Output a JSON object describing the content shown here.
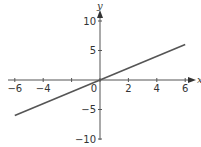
{
  "chart_data": {
    "type": "line",
    "title": "",
    "xlabel": "x",
    "ylabel": "y",
    "xlim": [
      -6,
      6
    ],
    "ylim": [
      -10,
      10
    ],
    "grid": false,
    "x_ticks": [
      -6,
      -4,
      -2,
      0,
      2,
      4,
      6
    ],
    "x_tick_labels": [
      "−6",
      "−4",
      "",
      "0",
      "2",
      "4",
      "6"
    ],
    "y_ticks": [
      -10,
      -5,
      5,
      10
    ],
    "y_tick_labels": [
      "−10",
      "−5",
      "5",
      "10"
    ],
    "series": [
      {
        "name": "y = x",
        "x": [
          -6,
          6
        ],
        "y": [
          -6,
          6
        ],
        "color": "#555555"
      }
    ]
  }
}
